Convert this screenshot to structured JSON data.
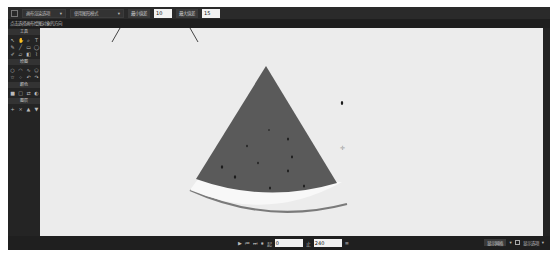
{
  "toolbar": {
    "render_options_label": "画布渲染选项",
    "mode_label": "使用图形模式",
    "min_label": "最小值差",
    "min_value": "10",
    "max_label": "最大值差",
    "max_value": "15"
  },
  "hint": {
    "text": "点击选择画布绘图对象的方向"
  },
  "left_panel": {
    "sections": [
      {
        "title": "工具",
        "icons": [
          "arrow",
          "hand",
          "zoom",
          "text",
          "pen",
          "line",
          "rect",
          "ellipse",
          "brush",
          "eraser",
          "fill",
          "eyedrop"
        ]
      },
      {
        "title": "绘图",
        "icons": [
          "circle",
          "arc",
          "curve",
          "polygon",
          "star",
          "spray",
          "undo",
          "redo"
        ]
      },
      {
        "title": "颜色",
        "icons": [
          "fg",
          "bg",
          "swap",
          "reset"
        ]
      },
      {
        "title": "图层",
        "icons": [
          "add",
          "del",
          "up",
          "down"
        ]
      }
    ]
  },
  "canvas": {
    "background": "#ececec",
    "flesh_color": "#5a5a5a",
    "rind_color": "#f8f8f8",
    "rind_outline": "#7a7a7a",
    "seed_color": "#1c1c1c"
  },
  "bottombar": {
    "playback_icons": [
      "play",
      "prev",
      "next",
      "end"
    ],
    "start_label": "起",
    "start_value": "0",
    "end_label": "止",
    "end_value": "240",
    "right_button": "显示网格",
    "right_checkbox_label": "对齐",
    "right_dropdown": "显示选项"
  }
}
